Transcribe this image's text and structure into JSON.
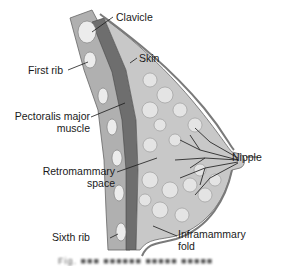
{
  "diagram": {
    "labels": {
      "clavicle": "Clavicle",
      "skin": "Skin",
      "first_rib": "First rib",
      "pectoralis_line1": "Pectoralis major",
      "pectoralis_line2": "muscle",
      "nipple": "Nipple",
      "retromammary_line1": "Retromammary",
      "retromammary_line2": "space",
      "sixth_rib": "Sixth rib",
      "inframammary_line1": "Inframammary",
      "inframammary_line2": "fold"
    },
    "caption": "Fig. ■■■ ■■■■■■ ■■■■■ ■■■■■"
  },
  "colors": {
    "chest_wall": "#a9a9a9",
    "pectoralis": "#6e6e6e",
    "glandular": "#c8c8c8",
    "fat_lobules": "#e0e0e0",
    "skin": "#9a9a9a",
    "rib": "#ececec",
    "ducts": "#2a2a2a"
  }
}
